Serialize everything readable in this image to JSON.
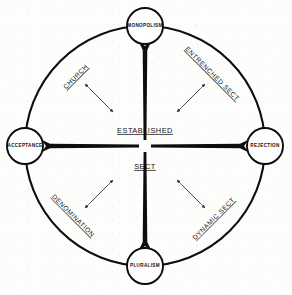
{
  "diagram": {
    "geometry": {
      "center_x": 145,
      "center_y": 146,
      "ring_radius": 120,
      "node_radius": 18
    },
    "colors": {
      "ink": "#0d0d0d",
      "arrow": "#3a3a3a",
      "paper": "#fdfdfc"
    },
    "nodes": [
      {
        "id": "monopolism",
        "label": "MONOPOLISM",
        "position": "top",
        "cx": 145,
        "cy": 26
      },
      {
        "id": "rejection",
        "label": "REJECTION",
        "position": "right",
        "cx": 265,
        "cy": 146
      },
      {
        "id": "pluralism",
        "label": "PLURALISM",
        "position": "bottom",
        "cx": 145,
        "cy": 266
      },
      {
        "id": "acceptance",
        "label": "ACCEPTANCE",
        "position": "left",
        "cx": 25,
        "cy": 146
      }
    ],
    "axis_labels": [
      {
        "id": "established",
        "label": "ESTABLISHED",
        "x": 145,
        "y": 131
      },
      {
        "id": "sect",
        "label": "SECT",
        "x": 145,
        "y": 167
      }
    ],
    "quadrant_labels": [
      {
        "id": "church",
        "label": "CHURCH",
        "quadrant": "top-left",
        "x": 76,
        "y": 77,
        "rotation": -45
      },
      {
        "id": "entrenched-sect",
        "label": "ENTRENCHED SECT",
        "quadrant": "top-right",
        "x": 212,
        "y": 74,
        "rotation": 45
      },
      {
        "id": "denomination",
        "label": "DENOMINATION",
        "quadrant": "bottom-left",
        "x": 73,
        "y": 216,
        "rotation": 45
      },
      {
        "id": "dynamic-sect",
        "label": "DYNAMIC SECT",
        "quadrant": "bottom-right",
        "x": 214,
        "y": 219,
        "rotation": -45
      }
    ]
  }
}
